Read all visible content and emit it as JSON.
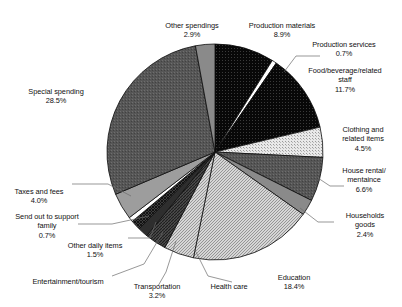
{
  "chart_data": {
    "type": "pie",
    "title": "",
    "subtitle": "",
    "xlabel": "",
    "ylabel": "",
    "legend_position": "none",
    "grid": false,
    "unit": "%",
    "center": {
      "x": 215,
      "y": 152
    },
    "radius": 108,
    "start_angle_deg": 0,
    "direction": "clockwise",
    "categories": [
      "Production materials",
      "Production services",
      "Food/beverage/related staff",
      "Clothing and related items",
      "House rental/mentaince",
      "Households goods",
      "Education",
      "Health care",
      "Transportation",
      "Entertainment/tourism",
      "Other daily items",
      "Send out to support family",
      "Taxes and fees",
      "Special spending",
      "Other spendings"
    ],
    "values": [
      8.9,
      0.7,
      11.7,
      4.5,
      6.6,
      2.4,
      18.4,
      4.5,
      3.2,
      1.5,
      1.5,
      0.7,
      4.0,
      28.5,
      2.9
    ],
    "slices": [
      {
        "label": "Production materials",
        "value": 8.9,
        "pct_text": "8.9%",
        "fill": "dots-dark",
        "color": "#0a0a0a"
      },
      {
        "label": "Production services",
        "value": 0.7,
        "pct_text": "0.7%",
        "fill": "solid-white",
        "color": "#ffffff"
      },
      {
        "label": "Food/beverage/related staff",
        "value": 11.7,
        "pct_text": "11.7%",
        "fill": "dots-dark",
        "color": "#0a0a0a"
      },
      {
        "label": "Clothing and related items",
        "value": 4.5,
        "pct_text": "4.5%",
        "fill": "dots-light",
        "color": "#dcdcdc"
      },
      {
        "label": "House rental/mentaince",
        "value": 6.6,
        "pct_text": "6.6%",
        "fill": "dots-darkgray",
        "color": "#5a5a5a"
      },
      {
        "label": "Households goods",
        "value": 2.4,
        "pct_text": "2.4%",
        "fill": "solid-midgray",
        "color": "#8f8f8f"
      },
      {
        "label": "Education",
        "value": 18.4,
        "pct_text": "18.4%",
        "fill": "hatch-light",
        "color": "#cfcfcf"
      },
      {
        "label": "Health care",
        "value": 4.5,
        "pct_text": "",
        "fill": "hatch-light",
        "color": "#cfcfcf"
      },
      {
        "label": "Transportation",
        "value": 3.2,
        "pct_text": "3.2%",
        "fill": "hatch-dark",
        "color": "#4a4a4a"
      },
      {
        "label": "Entertainment/tourism",
        "value": 1.5,
        "pct_text": "",
        "fill": "solid-dark",
        "color": "#2b2b2b"
      },
      {
        "label": "Other daily items",
        "value": 1.5,
        "pct_text": "1.5%",
        "fill": "cross-dark",
        "color": "#3a3a3a"
      },
      {
        "label": "Send out to support family",
        "value": 0.7,
        "pct_text": "0.7%",
        "fill": "solid-white",
        "color": "#ffffff"
      },
      {
        "label": "Taxes and fees",
        "value": 4.0,
        "pct_text": "4.0%",
        "fill": "solid-gray",
        "color": "#9a9a9a"
      },
      {
        "label": "Special spending",
        "value": 28.5,
        "pct_text": "28.5%",
        "fill": "dots-darkgray",
        "color": "#555555"
      },
      {
        "label": "Other spendings",
        "value": 2.9,
        "pct_text": "2.9%",
        "fill": "solid-midgray",
        "color": "#878787"
      }
    ]
  },
  "labels": {
    "other_spendings": {
      "name": "Other spendings",
      "pct": "2.9%"
    },
    "production_materials": {
      "name": "Production materials",
      "pct": "8.9%"
    },
    "production_services": {
      "name": "Production services",
      "pct": "0.7%"
    },
    "food_beverage": {
      "name": "Food/beverage/related\nstaff",
      "pct": "11.7%"
    },
    "clothing": {
      "name": "Clothing and\nrelated items",
      "pct": "4.5%"
    },
    "house_rental": {
      "name": "House rental/\nmentaince",
      "pct": "6.6%"
    },
    "households_goods": {
      "name": "Households\ngoods",
      "pct": "2.4%"
    },
    "education": {
      "name": "Education",
      "pct": "18.4%"
    },
    "health_care": {
      "name": "Health care",
      "pct": ""
    },
    "transportation": {
      "name": "Transportation",
      "pct": "3.2%"
    },
    "entertainment": {
      "name": "Entertainment/tourism",
      "pct": ""
    },
    "other_daily": {
      "name": "Other daily items",
      "pct": "1.5%"
    },
    "send_out": {
      "name": "Send out to support\nfamily",
      "pct": "0.7%"
    },
    "taxes": {
      "name": "Taxes and fees",
      "pct": "4.0%"
    },
    "special_spending": {
      "name": "Special spending",
      "pct": "28.5%"
    }
  }
}
